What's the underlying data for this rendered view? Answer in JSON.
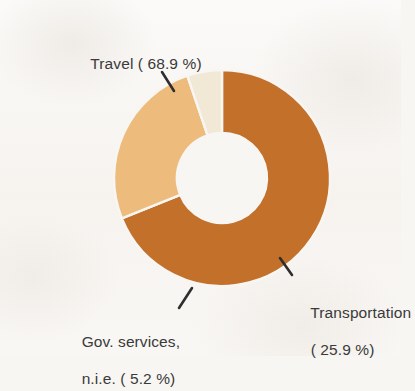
{
  "chart_data": {
    "type": "pie",
    "variant": "donut",
    "title": "",
    "subtitle": "",
    "xlabel": "",
    "ylabel": "",
    "legend_position": "none",
    "grid": false,
    "start_angle_deg": 0,
    "direction": "clockwise",
    "inner_radius_ratio": 0.42,
    "categories": [
      "Travel",
      "Transportation",
      "Gov. services, n.i.e."
    ],
    "values": [
      68.9,
      25.9,
      5.2
    ],
    "unit": "%",
    "slices": [
      {
        "name": "Travel",
        "value": 68.9,
        "label_line1": "Travel ( 68.9 %)",
        "label_line2": "",
        "color": "#c2702a"
      },
      {
        "name": "Transportation",
        "value": 25.9,
        "label_line1": "Transportation",
        "label_line2": "( 25.9 %)",
        "color": "#edbc7c"
      },
      {
        "name": "Gov. services, n.i.e.",
        "value": 5.2,
        "label_line1": "Gov. services,",
        "label_line2": "n.i.e. ( 5.2 %)",
        "color": "#f1e9d6"
      }
    ]
  },
  "colors": {
    "background": "#f8f6f3",
    "hole": "#f8f6f3",
    "text": "#3a3a3a",
    "leader": "#2e2e2e",
    "slice_gap": "#f8f6f3"
  }
}
